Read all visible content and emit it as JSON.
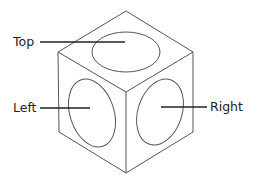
{
  "diagram": {
    "type": "isometric-cube-views",
    "colors": {
      "background": "#ffffff",
      "cube_stroke": "#555555",
      "leader_stroke": "#222222",
      "text": "#222222"
    },
    "cube": {
      "top_vertex": [
        126,
        11
      ],
      "left_top": [
        58,
        52
      ],
      "right_top": [
        193,
        52
      ],
      "center": [
        126,
        92
      ],
      "left_bottom": [
        59,
        132
      ],
      "right_bottom": [
        193,
        132
      ],
      "bottom_vertex": [
        126,
        173
      ]
    },
    "faces": [
      {
        "id": "top",
        "ellipse": {
          "cx": 126,
          "cy": 52,
          "rx": 34,
          "ry": 20,
          "rotate": 0
        }
      },
      {
        "id": "left",
        "ellipse": {
          "cx": 92,
          "cy": 113,
          "rx": 22,
          "ry": 35,
          "rotate": -18
        }
      },
      {
        "id": "right",
        "ellipse": {
          "cx": 160,
          "cy": 112,
          "rx": 22,
          "ry": 34,
          "rotate": 18
        }
      }
    ],
    "labels": [
      {
        "id": "top",
        "text": "Top",
        "x": 13,
        "y": 35,
        "leader": [
          40,
          42,
          125,
          42
        ]
      },
      {
        "id": "left",
        "text": "Left",
        "x": 13,
        "y": 101,
        "leader": [
          40,
          108,
          90,
          108
        ]
      },
      {
        "id": "right",
        "text": "Right",
        "x": 210,
        "y": 100,
        "leader": [
          161,
          107,
          207,
          107
        ]
      }
    ]
  }
}
